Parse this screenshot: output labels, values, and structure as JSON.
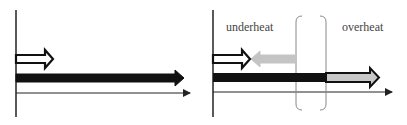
{
  "panels": [
    {
      "name": "left-panel",
      "arrows": [
        "white-arrow",
        "black-arrow"
      ]
    },
    {
      "name": "right-panel",
      "labels": {
        "left": "underheat",
        "right": "overheat"
      },
      "arrows": [
        "white-arrow",
        "gray-arrow-left",
        "black-arrow",
        "gray-arrow-right"
      ]
    }
  ],
  "colors": {
    "axis": "#222222",
    "black_arrow": "#111111",
    "gray_arrow": "#bdbdbd",
    "bracket": "#888888"
  }
}
